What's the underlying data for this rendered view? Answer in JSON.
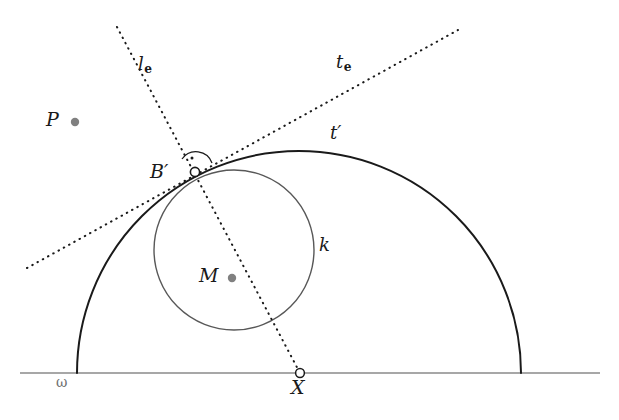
{
  "figure": {
    "background": "#ffffff",
    "width": 619,
    "height": 420
  },
  "colors": {
    "stroke_dark": "#1a1a1a",
    "stroke_gray": "#585858",
    "baseline_gray": "#8a8a8a",
    "point_fill_gray": "#808080",
    "label_gray": "#6f6f6f",
    "marker_outline": "#1a1a1a",
    "marker_fill": "#ffffff"
  },
  "labels": {
    "P": "P",
    "B_prime": "B′",
    "M": "M",
    "X": "X",
    "k": "k",
    "t_prime": "t′",
    "omega": "ω",
    "l_e_main": "l",
    "l_e_sub": "e",
    "t_e_main": "t",
    "t_e_sub": "e"
  },
  "points": [
    {
      "name": "P",
      "label": "P",
      "x": 75,
      "y": 122,
      "marker": "filled-gray-dot",
      "label_x": 46,
      "label_y": 113
    },
    {
      "name": "B_prime",
      "label": "B′",
      "x": 195,
      "y": 172,
      "marker": "open-circle",
      "label_x": 153,
      "label_y": 165
    },
    {
      "name": "M",
      "label": "M",
      "x": 232,
      "y": 278,
      "marker": "filled-gray-dot",
      "label_x": 200,
      "label_y": 269
    },
    {
      "name": "X",
      "label": "X",
      "x": 300,
      "y": 373,
      "marker": "open-circle",
      "label_x": 291,
      "label_y": 378
    }
  ],
  "curves": [
    {
      "name": "omega-baseline",
      "type": "line",
      "x1": 20,
      "y1": 373,
      "x2": 600,
      "y2": 373,
      "style": "solid",
      "color": "#8a8a8a",
      "width": 1.4
    },
    {
      "name": "t-prime-arc",
      "type": "arc",
      "center_x": 299,
      "center_y": 373,
      "radius": 222,
      "from_x": 77,
      "from_y": 373,
      "to_x": 521,
      "to_y": 373,
      "style": "solid",
      "color": "#1a1a1a",
      "width": 2
    },
    {
      "name": "circle-k",
      "type": "circle",
      "center_x": 234,
      "center_y": 250,
      "radius": 80,
      "style": "solid",
      "color": "#585858",
      "width": 1.4
    },
    {
      "name": "line-l-e",
      "type": "line",
      "x1": 117,
      "y1": 27,
      "x2": 300,
      "y2": 373,
      "style": "dotted",
      "color": "#1a1a1a",
      "width": 2
    },
    {
      "name": "line-t-e",
      "type": "line",
      "x1": 27,
      "y1": 268,
      "x2": 458,
      "y2": 30,
      "style": "dotted",
      "color": "#1a1a1a",
      "width": 2
    },
    {
      "name": "right-angle-marker",
      "type": "arc-with-dot",
      "at_x": 195,
      "at_y": 172,
      "radius": 16,
      "style": "solid",
      "color": "#1a1a1a",
      "width": 1.2
    }
  ],
  "line_labels": [
    {
      "name": "l-e",
      "main": "l",
      "sub": "e",
      "x": 138,
      "y": 56
    },
    {
      "name": "t-e",
      "main": "t",
      "sub": "e",
      "x": 336,
      "y": 54
    },
    {
      "name": "t-prime",
      "main": "t′",
      "sub": "",
      "x": 330,
      "y": 125
    },
    {
      "name": "k",
      "main": "k",
      "sub": "",
      "x": 319,
      "y": 238
    },
    {
      "name": "omega",
      "main": "ω",
      "sub": "",
      "x": 56,
      "y": 376
    }
  ]
}
